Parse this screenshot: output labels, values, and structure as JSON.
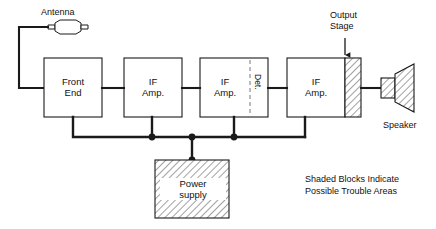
{
  "figure": {
    "type": "block-diagram",
    "caption": "Shaded Blocks Indicate\nPossible Trouble Areas"
  },
  "labels": {
    "antenna": "Antenna",
    "output_stage": "Output\nStage",
    "speaker": "Speaker",
    "detector": "Det.",
    "power_supply": "Power\nsupply"
  },
  "blocks": [
    {
      "id": "front-end",
      "label": "Front\nEnd",
      "shaded": false
    },
    {
      "id": "if-amp-1",
      "label": "IF\nAmp.",
      "shaded": false
    },
    {
      "id": "if-amp-2",
      "label": "IF\nAmp.",
      "shaded": false
    },
    {
      "id": "if-amp-3",
      "label": "IF\nAmp.",
      "shaded": false
    },
    {
      "id": "output-stage",
      "label": "",
      "shaded": true
    },
    {
      "id": "power-supply",
      "label": "Power\nsupply",
      "shaded": true
    },
    {
      "id": "speaker",
      "label": "Speaker",
      "shaded": true
    }
  ],
  "colors": {
    "stroke": "#1a1a1a",
    "hatch": "#555555",
    "background": "#ffffff",
    "text": "#111111"
  }
}
